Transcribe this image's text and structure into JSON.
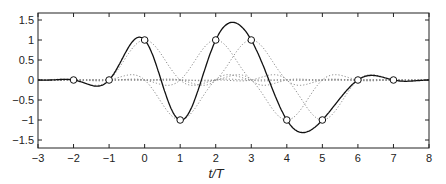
{
  "chart_data": {
    "type": "line",
    "title": "",
    "xlabel": "t/T",
    "ylabel": "",
    "xlim": [
      -3,
      8
    ],
    "ylim": [
      -1.7,
      1.65
    ],
    "xticks": [
      -3,
      -2,
      -1,
      0,
      1,
      2,
      3,
      4,
      5,
      6,
      7,
      8
    ],
    "xtick_labels": [
      "−3",
      "−2",
      "−1",
      "0",
      "1",
      "2",
      "3",
      "4",
      "5",
      "6",
      "7",
      "8"
    ],
    "yticks": [
      1.5,
      1,
      0.5,
      0,
      -0.5,
      -1,
      -1.5
    ],
    "ytick_labels": [
      "1.5",
      "1",
      "0.5",
      "0",
      "−0.5",
      "−1",
      "−1.5"
    ],
    "grid": false,
    "samples": {
      "t": [
        -2,
        -1,
        0,
        1,
        2,
        3,
        4,
        5,
        6,
        7
      ],
      "a": [
        0,
        0,
        1,
        -1,
        1,
        1,
        -1,
        -1,
        0,
        0
      ]
    },
    "series": [
      {
        "name": "sum of pulses",
        "style": "solid",
        "color": "#111111"
      },
      {
        "name": "individual pulses",
        "style": "dotted",
        "color": "#888888"
      },
      {
        "name": "sample points",
        "style": "circle-markers",
        "color": "#111111"
      }
    ],
    "pulse": {
      "shape": "raised-cosine",
      "rolloff": 0.5
    }
  }
}
